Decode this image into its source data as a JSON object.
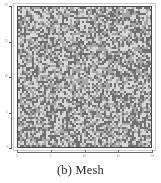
{
  "figure": {
    "caption": "(b) Mesh",
    "panel_label": "(b)",
    "panel_title": "Mesh"
  },
  "chart_data": {
    "type": "scatter",
    "title": "",
    "subtitle": "",
    "xlabel": "",
    "ylabel": "",
    "xlim": [
      0,
      20
    ],
    "ylim": [
      0,
      20
    ],
    "xticks": [
      0,
      5,
      10,
      15,
      20
    ],
    "xticklabels": [
      "0",
      "5",
      "10",
      "15",
      "20"
    ],
    "yticks": [
      0,
      5,
      10,
      15,
      20
    ],
    "yticklabels": [
      "0",
      "5",
      "10",
      "15",
      "20"
    ],
    "grid": false,
    "legend": null,
    "background_fill": "#a8a8a8",
    "mesh": {
      "description": "dense random speckled mesh fill covering the full domain",
      "point_color_dark": "#707070",
      "point_color_light": "#d8d8d8",
      "density": 0.55,
      "cell_size_px": 2
    },
    "annotations": [
      {
        "name": "left-ellipse",
        "shape": "ellipse",
        "cx": 4.6,
        "cy": 10.4,
        "rx": 1.55,
        "ry": 6.2,
        "stroke": "#1c1c1c",
        "fill": "none"
      },
      {
        "name": "upper-right-ellipse",
        "shape": "ellipse",
        "cx": 13.7,
        "cy": 14.3,
        "rx": 4.4,
        "ry": 1.75,
        "stroke": "#1c1c1c",
        "fill": "none"
      },
      {
        "name": "lower-right-ellipse",
        "shape": "ellipse",
        "cx": 13.2,
        "cy": 6.1,
        "rx": 4.5,
        "ry": 1.9,
        "stroke": "#1c1c1c",
        "fill": "none"
      }
    ]
  },
  "colors": {
    "axis": "#6b6b6b",
    "plot_border": "#4a4a4a",
    "frame": "#cfcfcf",
    "ellipse_stroke": "#1c1c1c",
    "caption_text": "#2b2b2b",
    "ticklabel_text": "#8a8a8a"
  }
}
